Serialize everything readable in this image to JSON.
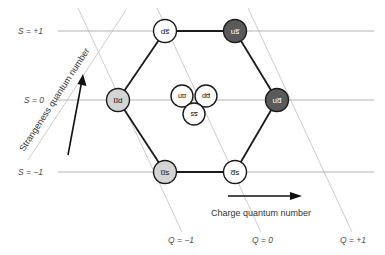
{
  "axes": {
    "y_ticks": [
      {
        "label": "S = +1",
        "value": 1
      },
      {
        "label": "S = 0",
        "value": 0
      },
      {
        "label": "S = −1",
        "value": -1
      }
    ],
    "x_ticks": [
      {
        "label": "Q = −1",
        "value": -1
      },
      {
        "label": "Q = 0",
        "value": 0
      },
      {
        "label": "Q = +1",
        "value": 1
      }
    ],
    "y_axis_title": "Strangeness quantum number",
    "x_axis_title": "Charge quantum number"
  },
  "nodes": {
    "top_left": {
      "label": "ds̅",
      "fill": "white",
      "S": 1,
      "Q": 0
    },
    "top_right": {
      "label": "us̅",
      "fill": "dark",
      "S": 1,
      "Q": 1
    },
    "mid_left": {
      "label": "u̅d",
      "fill": "light",
      "S": 0,
      "Q": -1
    },
    "mid_right": {
      "label": "ud̅",
      "fill": "dark",
      "S": 0,
      "Q": 1
    },
    "bottom_left": {
      "label": "u̅s",
      "fill": "light",
      "S": -1,
      "Q": -1
    },
    "bottom_right": {
      "label": "d̅s",
      "fill": "white",
      "S": -1,
      "Q": 0
    },
    "center_uubar": {
      "label": "uu̅",
      "fill": "white",
      "S": 0,
      "Q": 0
    },
    "center_ddbar": {
      "label": "dd̅",
      "fill": "white",
      "S": 0,
      "Q": 0
    },
    "center_ssbar": {
      "label": "ss̅",
      "fill": "white",
      "S": 0,
      "Q": 0
    }
  },
  "colors": {
    "node_white": "#ffffff",
    "node_light": "#d4d4d4",
    "node_dark": "#5a5a5a",
    "bond": "#1a1a1a",
    "axis_line": "#b3b3b3",
    "guide_line": "#cccccc",
    "text": "#333333"
  }
}
